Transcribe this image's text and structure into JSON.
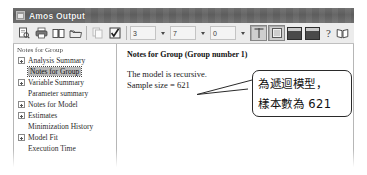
{
  "window": {
    "title": "Amos Output",
    "icon": "app-window-icon"
  },
  "toolbar": {
    "buttons": [
      {
        "name": "print-preview-icon",
        "label": ""
      },
      {
        "name": "print-icon",
        "label": ""
      },
      {
        "name": "book-open-icon",
        "label": ""
      },
      {
        "name": "open-folder-icon",
        "label": ""
      },
      {
        "name": "copy-icon",
        "label": ""
      },
      {
        "name": "checkmark-options-icon",
        "label": ""
      }
    ],
    "spinners": [
      {
        "name": "decimal-places-1",
        "value": "3"
      },
      {
        "name": "decimal-places-2",
        "value": "7"
      },
      {
        "name": "decimal-places-3",
        "value": "0"
      }
    ],
    "view_toggles": [
      {
        "name": "split-horizontal-toggle",
        "pressed": true
      },
      {
        "name": "split-vertical-toggle",
        "pressed": true
      }
    ],
    "dark_buttons": [
      {
        "name": "display-window-1-button"
      },
      {
        "name": "display-window-2-button"
      }
    ],
    "help_label": "?",
    "help_book": "help-book-icon"
  },
  "tree": {
    "root_label": "Notes for Group",
    "items": [
      {
        "label": "Analysis Summary",
        "expandable": true,
        "selected": false
      },
      {
        "label": "Notes for Group",
        "expandable": false,
        "selected": true
      },
      {
        "label": "Variable Summary",
        "expandable": true,
        "selected": false
      },
      {
        "label": "Parameter summary",
        "expandable": false,
        "selected": false
      },
      {
        "label": "Notes for Model",
        "expandable": true,
        "selected": false
      },
      {
        "label": "Estimates",
        "expandable": true,
        "selected": false
      },
      {
        "label": "Minimization History",
        "expandable": false,
        "selected": false
      },
      {
        "label": "Model Fit",
        "expandable": true,
        "selected": false
      },
      {
        "label": "Execution Time",
        "expandable": false,
        "selected": false
      }
    ]
  },
  "document": {
    "heading": "Notes for Group (Group number 1)",
    "lines": [
      "The model is recursive.",
      "Sample size = 621"
    ]
  },
  "annotation": {
    "line1": "為遞迴模型，",
    "line2": "樣本數為 621"
  }
}
